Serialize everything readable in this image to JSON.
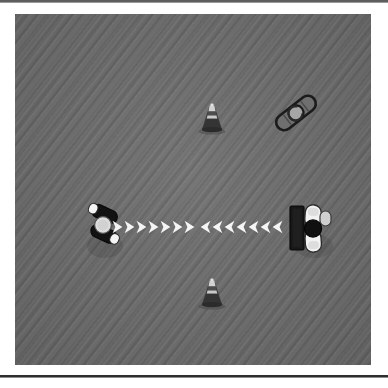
{
  "page": {
    "background_color": "#ffffff",
    "field_color": "#6b6b6b",
    "field_texture": "diagonal-weave",
    "rule_color": "#3a3a3a"
  },
  "field": {
    "name": "training-field",
    "x": 15,
    "y": 14,
    "width": 356,
    "height": 351
  },
  "objects": [
    {
      "id": "cone-top",
      "kind": "traffic-cone",
      "label": "Traffic Cone (top)",
      "x": 195,
      "y": 118,
      "body_color": "#3b3b3b",
      "band_color": "#cfcfcf"
    },
    {
      "id": "cone-bottom",
      "kind": "traffic-cone",
      "label": "Traffic Cone (bottom)",
      "x": 195,
      "y": 293,
      "body_color": "#3b3b3b",
      "band_color": "#cfcfcf"
    },
    {
      "id": "equipment-roller",
      "kind": "foam-roller",
      "label": "Foam Roller",
      "x": 284,
      "y": 101,
      "rotation_deg": -38,
      "body_color": "#6e6e6e",
      "outline_color": "#1c1c1c",
      "hub_color": "#a8a8a8"
    },
    {
      "id": "player-left",
      "kind": "athlete-feet",
      "label": "Athlete A (left)",
      "x": 90,
      "y": 214,
      "shoe_color": "#131313",
      "sole_color": "#f2f2f2",
      "body_color": "#d9d9d9"
    },
    {
      "id": "player-right",
      "kind": "athlete-feet",
      "label": "Athlete B (right)",
      "x": 297,
      "y": 214,
      "shoe_color": "#131313",
      "sole_color": "#f2f2f2",
      "body_color": "#d9d9d9",
      "mat_color": "#1a1a1a"
    }
  ],
  "arrows": {
    "color": "#f5f5f5",
    "lane_y": 214,
    "right_group": {
      "name": "arrows-rightward",
      "direction": "right",
      "count": 7,
      "glyph": "chevron-right",
      "start_x": 112,
      "spacing": 12
    },
    "left_group": {
      "name": "arrows-leftward",
      "direction": "left",
      "count": 7,
      "glyph": "chevron-left",
      "start_x": 200,
      "spacing": 12
    }
  }
}
